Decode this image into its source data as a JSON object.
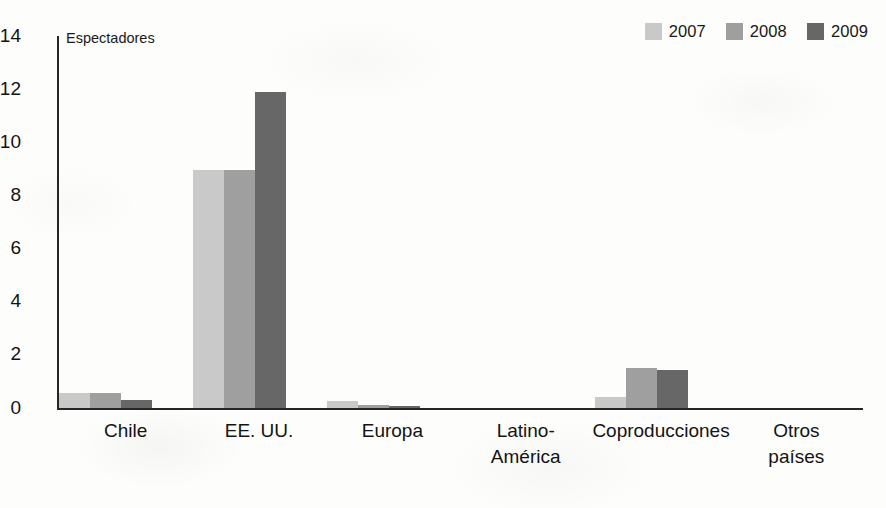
{
  "chart_data": {
    "type": "bar",
    "title": "",
    "axis_title": "Espectadores",
    "xlabel": "",
    "ylabel": "Espectadores",
    "ylim": [
      0,
      14
    ],
    "yticks": [
      0,
      2,
      4,
      6,
      8,
      10,
      12,
      14
    ],
    "ytick_labels": [
      "0",
      "2",
      "4",
      "6",
      "8",
      "10",
      "12",
      "14"
    ],
    "grid": false,
    "legend_position": "top-right",
    "categories": [
      "Chile",
      "EE. UU.",
      "Europa",
      "Latino-\nAmérica",
      "Coproducciones",
      "Otros\npaíses"
    ],
    "series": [
      {
        "name": "2007",
        "color": "#c9c9c9",
        "values": [
          0.55,
          8.95,
          0.25,
          0,
          0.4,
          0
        ]
      },
      {
        "name": "2008",
        "color": "#9f9f9f",
        "values": [
          0.55,
          8.95,
          0.1,
          0,
          1.5,
          0
        ]
      },
      {
        "name": "2009",
        "color": "#676767",
        "values": [
          0.3,
          11.9,
          0.07,
          0,
          1.4,
          0
        ]
      }
    ]
  },
  "colors": {
    "axis": "#262626",
    "text": "#131313",
    "background": "#fdfdfb"
  }
}
